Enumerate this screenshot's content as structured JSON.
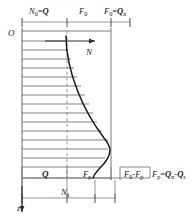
{
  "figure": {
    "type": "engineering-diagram",
    "colors": {
      "curve": "#1a1a1a",
      "frame": "#6e6e6e",
      "hatch": "#7a7a7a",
      "dashed": "#8a8a8a",
      "text": "#1a1a1a",
      "background": "#ffffff"
    },
    "axes": {
      "origin_label": "O",
      "horizontal_axis_label": "N",
      "vertical_axis_label": "z"
    },
    "top_labels": [
      {
        "id": "N0Q",
        "base": "N",
        "sub": "0",
        "op": "=",
        "bold": "Q",
        "bold_sub": ""
      },
      {
        "id": "F0",
        "base": "F",
        "sub": "0",
        "op": "",
        "bold": "",
        "bold_sub": ""
      },
      {
        "id": "F0Qn",
        "base": "F",
        "sub": "0",
        "op": "=",
        "bold": "Q",
        "bold_sub": "n"
      }
    ],
    "bottom_labels": [
      {
        "id": "Q",
        "base": "Q",
        "sub": "",
        "op": "",
        "bold": "",
        "bold_sub": ""
      },
      {
        "id": "Fp",
        "base": "F",
        "sub": "p",
        "op": "",
        "bold": "",
        "bold_sub": ""
      },
      {
        "id": "F0Fp",
        "base": "F",
        "sub": "0",
        "op": "-",
        "bold": "",
        "bold_sub": ""
      },
      {
        "id": "FpQnQs",
        "base": "F",
        "sub": "p",
        "op": "=",
        "bold": "Q",
        "bold_sub": "n"
      }
    ],
    "dimension_labels": [
      {
        "id": "N1",
        "base": "N",
        "sub": "1"
      }
    ],
    "text": {
      "N0_eq_Q": "N₀=Q",
      "F0": "F₀",
      "F0_eq_Qn": "F₀=Qₙ",
      "origin_O": "O",
      "axis_N": "N",
      "axis_z": "z",
      "Q": "Q",
      "Fp": "Fp",
      "F0_minus_Fp": "F₀-Fp",
      "Fp_eq_Qn_minus_Qs": "Fp=Qₙ-Qₛ",
      "N1": "N₁"
    },
    "hatch_line_count": 15,
    "curve_description": "Axial force N decreases with depth z, concave, reaching a minimum bulge near the pile toe then returning inward"
  }
}
